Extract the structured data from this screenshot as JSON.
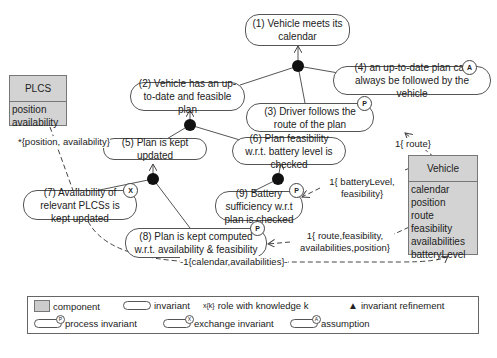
{
  "invariants": [
    {
      "id": 1,
      "text": "(1) Vehicle meets its calendar",
      "badge": ""
    },
    {
      "id": 2,
      "text": "(2) Vehicle has an up-to-date and feasible plan",
      "badge": ""
    },
    {
      "id": 3,
      "text": "(3) Driver follows the route of the plan",
      "badge": "P"
    },
    {
      "id": 4,
      "text": "(4)  an up-to-date plan can always be followed by the vehicle",
      "badge": "A"
    },
    {
      "id": 5,
      "text": "(5) Plan is kept updated",
      "badge": ""
    },
    {
      "id": 6,
      "text": "(6) Plan feasibility w.r.t. battery level is checked",
      "badge": ""
    },
    {
      "id": 7,
      "text": "(7) Availability of relevant PLCSs is kept updated",
      "badge": "X"
    },
    {
      "id": 8,
      "text": "(8) Plan is kept computed w.r.t. availability & feasibility",
      "badge": "P"
    },
    {
      "id": 9,
      "text": "(9) Battery sufficiency w.r.t plan is checked",
      "badge": "P"
    }
  ],
  "components": {
    "plcs": {
      "title": "PLCS",
      "attributes": [
        "position",
        "availability"
      ]
    },
    "vehicle": {
      "title": "Vehicle",
      "attributes": [
        "calendar",
        "position",
        "route",
        "feasibility",
        "availabilities",
        "batteryLevel"
      ]
    }
  },
  "roles": {
    "plcs_to_7": "*{position, availability}",
    "vehicle_to_3": "1{ route}",
    "vehicle_to_9": "1{ batteryLevel, feasibility}",
    "vehicle_to_8": "1{ route,feasibility, availabilities,position}",
    "7_to_vehicle": "-1{calendar,availabilities}-"
  },
  "legend": {
    "component": "component",
    "invariant": "invariant",
    "role_symbol": "x{k}",
    "role": "role with knowledge k",
    "refinement": "invariant refinement",
    "process": "process invariant",
    "exchange": "exchange invariant",
    "assumption": "assumption",
    "badge_p": "P",
    "badge_x": "X",
    "badge_a": "A"
  },
  "colors": {
    "component_fill": "#d3d3d3",
    "line": "#444444"
  }
}
